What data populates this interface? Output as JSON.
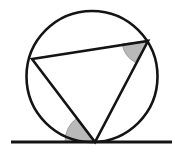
{
  "figure": {
    "background_color": "#ffffff",
    "stroke_color": "#141414",
    "shade_color": "#b9b9b9",
    "shade_stroke_color": "#8f8f8f",
    "canvas": {
      "width": 175,
      "height": 154
    }
  },
  "circle": {
    "name": "circumscribed-circle",
    "cx": 92,
    "cy": 76.5,
    "r": 65.5,
    "stroke_width": 2.6,
    "fill": "none"
  },
  "triangle": {
    "name": "inscribed-triangle",
    "stroke_width": 2.6,
    "fill": "none",
    "vertices": [
      {
        "label": "left-vertex",
        "x": 32,
        "y": 59
      },
      {
        "label": "right-vertex",
        "x": 148,
        "y": 41
      },
      {
        "label": "bottom-tangency-vertex",
        "x": 95,
        "y": 142
      }
    ],
    "points_attr": "32,59 148,41 95,142"
  },
  "tangent_line": {
    "name": "tangent-line",
    "x1": 11,
    "y1": 142,
    "x2": 172,
    "y2": 142,
    "stroke_width": 2.8
  },
  "angle_marks": [
    {
      "name": "inscribed-angle-shade",
      "vertex_x": 148,
      "vertex_y": 41,
      "radius": 26,
      "path": "M 148 41 L 122.1 43.9 A 26 26 0 0 0 135.3 62.4 Z"
    },
    {
      "name": "tangent-chord-angle-shade",
      "vertex_x": 95,
      "vertex_y": 142,
      "radius": 30,
      "path": "M 95 142 L 65 142 A 30 30 0 0 1 77.2 117.8 Z"
    }
  ],
  "chart_data": {
    "type": "diagram",
    "elements": [
      "circle",
      "inscribed triangle",
      "horizontal tangent line",
      "shaded inscribed angle at right vertex",
      "shaded tangent-chord angle at bottom vertex"
    ]
  }
}
